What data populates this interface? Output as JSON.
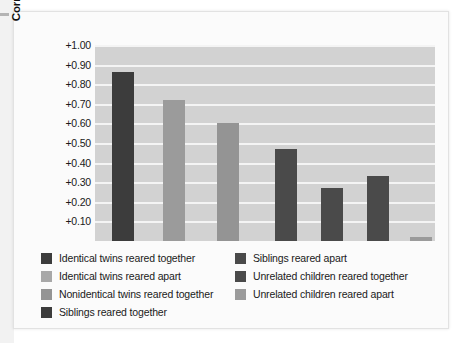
{
  "chart_data": {
    "type": "bar",
    "title": "",
    "xlabel": "",
    "ylabel": "Correlation of IQ scores",
    "ylim": [
      0,
      1.0
    ],
    "grid": true,
    "legend_position": "below-plot-two-columns",
    "y_ticks": [
      "+1.00",
      "+0.90",
      "+0.80",
      "+0.70",
      "+0.60",
      "+0.50",
      "+0.40",
      "+0.30",
      "+0.20",
      "+0.10"
    ],
    "y_tick_values": [
      1.0,
      0.9,
      0.8,
      0.7,
      0.6,
      0.5,
      0.4,
      0.3,
      0.2,
      0.1
    ],
    "categories": [
      "Identical twins reared together",
      "Identical twins reared apart",
      "Nonidentical twins reared together",
      "Siblings reared together",
      "Siblings reared apart",
      "Unrelated children reared together",
      "Unrelated children reared apart"
    ],
    "values": [
      0.86,
      0.72,
      0.6,
      0.47,
      0.27,
      0.33,
      0.02
    ],
    "colors": [
      "#3c3c3c",
      "#9b9b9b",
      "#949494",
      "#4a4a4a",
      "#4a4a4a",
      "#4a4a4a",
      "#9b9b9b"
    ],
    "bar_x_percent": [
      5.0,
      20.0,
      36.0,
      53.0,
      66.5,
      80.0,
      92.5
    ],
    "bar_width_percent": 6.5,
    "plot_background": "#d2d2d2",
    "gridline_color": "#f4f4f4"
  },
  "legend": {
    "left_column": [
      {
        "label": "Identical twins reared together",
        "color": "#3c3c3c"
      },
      {
        "label": "Identical twins reared apart",
        "color": "#a8a8a8"
      },
      {
        "label": "Nonidentical twins reared together",
        "color": "#949494"
      },
      {
        "label": "Siblings reared together",
        "color": "#3c3c3c"
      }
    ],
    "right_column": [
      {
        "label": "Siblings reared apart",
        "color": "#4a4a4a"
      },
      {
        "label": "Unrelated children reared together",
        "color": "#4a4a4a"
      },
      {
        "label": "Unrelated children reared apart",
        "color": "#9b9b9b"
      }
    ]
  }
}
